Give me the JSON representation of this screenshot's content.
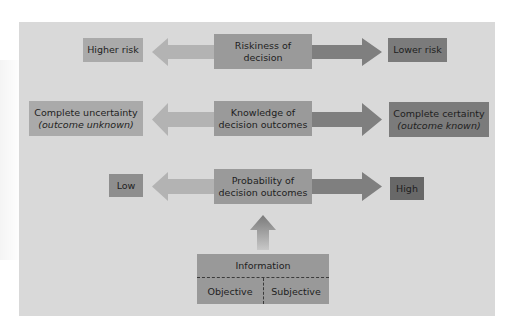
{
  "diagram": {
    "colors": {
      "background": "#d9d9d9",
      "left_arrow": "#b3b3b3",
      "right_arrow": "#7f7f7f",
      "left_box": "#aaaaaa",
      "center_box": "#9a9a9a",
      "right_box": "#7b7b7b",
      "high_box": "#686868"
    },
    "rows": [
      {
        "center": {
          "line1": "Riskiness of",
          "line2": "decision"
        },
        "left": {
          "line1": "Higher risk"
        },
        "right": {
          "line1": "Lower risk"
        }
      },
      {
        "center": {
          "line1": "Knowledge of",
          "line2": "decision outcomes"
        },
        "left": {
          "line1": "Complete uncertainty",
          "line2": "(outcome unknown)"
        },
        "right": {
          "line1": "Complete certainty",
          "line2": "(outcome known)"
        }
      },
      {
        "center": {
          "line1": "Probability of",
          "line2": "decision outcomes"
        },
        "left": {
          "line1": "Low"
        },
        "right": {
          "line1": "High"
        }
      }
    ],
    "information": {
      "title": "Information",
      "left": "Objective",
      "right": "Subjective"
    }
  }
}
